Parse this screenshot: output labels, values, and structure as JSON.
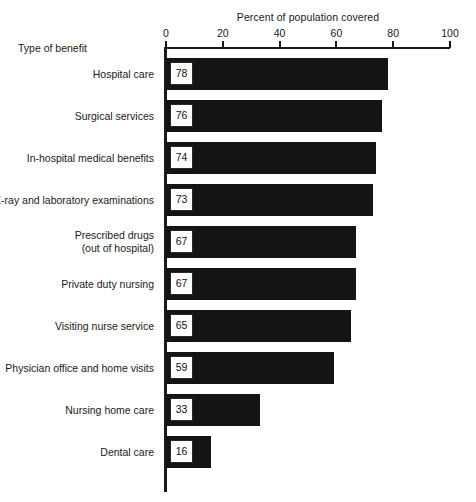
{
  "chart_data": {
    "type": "bar",
    "orientation": "horizontal",
    "title": "Percent of population covered",
    "xlabel": "Percent of population covered",
    "ylabel": "Type of benefit",
    "xlim": [
      0,
      100
    ],
    "xticks": [
      0,
      20,
      40,
      60,
      80,
      100
    ],
    "xtick_labels": [
      "0",
      "20",
      "40",
      "60",
      "80",
      "100"
    ],
    "grid": false,
    "legend": null,
    "bar_color": "#141414",
    "categories": [
      "Hospital care",
      "Surgical services",
      "In-hospital medical benefits",
      "X-ray and laboratory examinations",
      "Prescribed drugs (out of hospital)",
      "Private duty nursing",
      "Visiting nurse service",
      "Physician office and home visits",
      "Nursing home care",
      "Dental care"
    ],
    "values": [
      78,
      76,
      74,
      73,
      67,
      67,
      65,
      59,
      33,
      16
    ],
    "rows": [
      {
        "label_line1": "Hospital care",
        "label_line2": "",
        "value": 78,
        "value_label": "78"
      },
      {
        "label_line1": "Surgical services",
        "label_line2": "",
        "value": 76,
        "value_label": "76"
      },
      {
        "label_line1": "In-hospital medical benefits",
        "label_line2": "",
        "value": 74,
        "value_label": "74"
      },
      {
        "label_line1": "X-ray and laboratory examinations",
        "label_line2": "",
        "value": 73,
        "value_label": "73"
      },
      {
        "label_line1": "Prescribed drugs",
        "label_line2": "(out of hospital)",
        "value": 67,
        "value_label": "67"
      },
      {
        "label_line1": "Private duty nursing",
        "label_line2": "",
        "value": 67,
        "value_label": "67"
      },
      {
        "label_line1": "Visiting nurse service",
        "label_line2": "",
        "value": 65,
        "value_label": "65"
      },
      {
        "label_line1": "Physician office and home visits",
        "label_line2": "",
        "value": 59,
        "value_label": "59"
      },
      {
        "label_line1": "Nursing home care",
        "label_line2": "",
        "value": 33,
        "value_label": "33"
      },
      {
        "label_line1": "Dental care",
        "label_line2": "",
        "value": 16,
        "value_label": "16"
      }
    ]
  }
}
